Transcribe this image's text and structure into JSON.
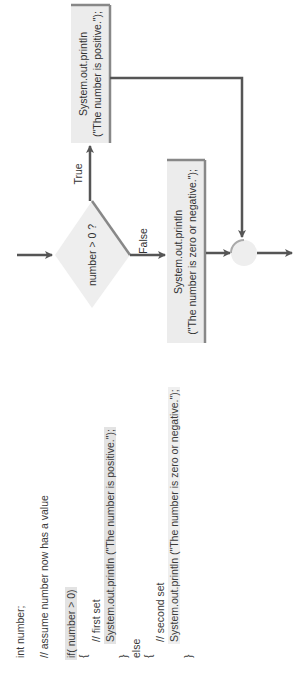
{
  "code": {
    "lines": [
      {
        "text": "int number;"
      },
      {
        "text": "// assume number now has a value"
      },
      {
        "text": "if( number > 0)"
      },
      {
        "text": "{"
      },
      {
        "text": "// first set"
      },
      {
        "text": "System.out.println (\"The number is positive.\");"
      },
      {
        "text": "}"
      },
      {
        "text": "else"
      },
      {
        "text": "{"
      },
      {
        "text": "// second set"
      },
      {
        "text": "System.out.println (\"The number is zero or negative.\");"
      },
      {
        "text": "}"
      }
    ]
  },
  "flowchart": {
    "decision": {
      "label": "number > 0 ?"
    },
    "true_branch": {
      "label": "True",
      "box_line1": "System.out.println",
      "box_line2": "(\"The number is positive.\");"
    },
    "false_branch": {
      "label": "False",
      "box_line1": "System.out.println",
      "box_line2": "(\"The number is zero or negative.\");"
    },
    "colors": {
      "line": "#555555",
      "box_fill": "#ececec",
      "box_shadow": "#888888",
      "diamond_fill": "#eeeeee",
      "highlight": "#e3e3e3"
    }
  }
}
